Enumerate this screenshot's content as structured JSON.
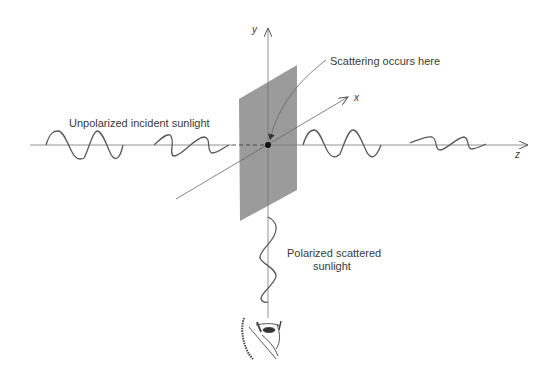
{
  "figure": {
    "labels": {
      "incident": "Unpolarized incident sunlight",
      "scattering": "Scattering occurs here",
      "scattered_line1": "Polarized scattered",
      "scattered_line2": "sunlight"
    },
    "axes": {
      "x": "x",
      "y": "y",
      "z": "z"
    },
    "colors": {
      "plane": "#9b9b9b",
      "line": "#555555",
      "wave": "#5a5a5a",
      "text": "#3a3a3a"
    },
    "icons": {
      "observer": "eye-icon"
    }
  }
}
